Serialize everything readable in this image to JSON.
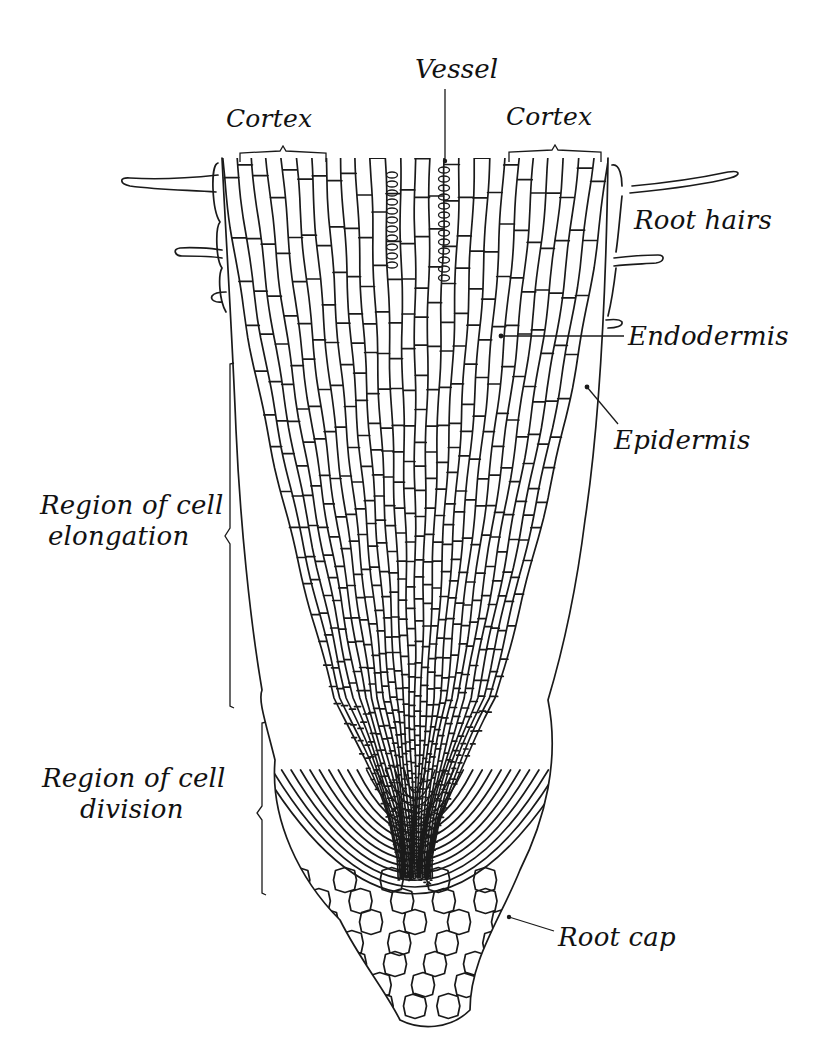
{
  "figure": {
    "colors": {
      "ink": "#1a1a1a",
      "background": "#ffffff"
    }
  },
  "labels": {
    "vessel": "Vessel",
    "cortex_left": "Cortex",
    "cortex_right": "Cortex",
    "root_hairs": "Root hairs",
    "endodermis": "Endodermis",
    "epidermis": "Epidermis",
    "region_elongation_line1": "Region of cell",
    "region_elongation_line2": "elongation",
    "region_division_line1": "Region of cell",
    "region_division_line2": "division",
    "root_cap": "Root cap"
  }
}
